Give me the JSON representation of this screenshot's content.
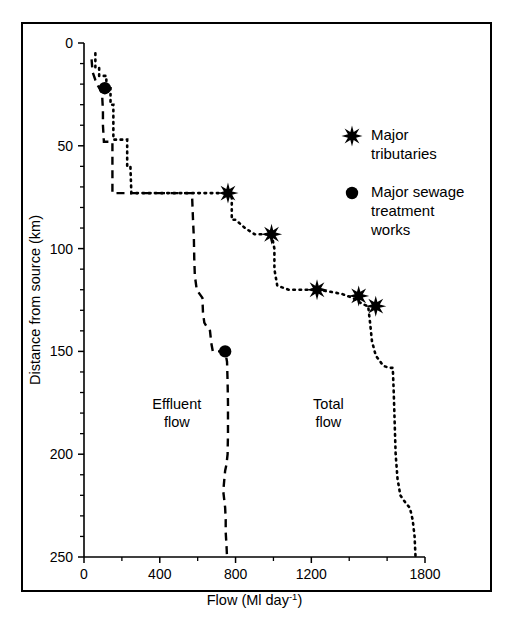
{
  "figure": {
    "frame_color": "#000000",
    "background": "#ffffff"
  },
  "chart_data": {
    "type": "line",
    "title": "",
    "xlabel_main": "Flow (Ml day",
    "xlabel_sup": "-1",
    "xlabel_tail": ")",
    "ylabel": "Distance from source (km)",
    "xlim": [
      0,
      1800
    ],
    "ylim": [
      0,
      250
    ],
    "y_inverted": true,
    "grid": false,
    "x_ticks": [
      0,
      400,
      800,
      1200,
      1800
    ],
    "x_tick_labels": [
      "0",
      "400",
      "800",
      "1200",
      "1800"
    ],
    "x_minor_ticks": [
      200,
      600,
      1000,
      1400,
      1600
    ],
    "y_ticks": [
      0,
      50,
      100,
      150,
      200,
      250
    ],
    "y_tick_labels": [
      "0",
      "50",
      "100",
      "150",
      "200",
      "250"
    ],
    "y_minor_ticks": [
      10,
      20,
      30,
      40,
      60,
      70,
      80,
      90,
      110,
      120,
      130,
      140,
      160,
      170,
      180,
      190,
      210,
      220,
      230,
      240
    ],
    "series": [
      {
        "name": "Total flow",
        "style": "dotted",
        "annotation": "Total flow",
        "annotation_x": 1290,
        "annotation_y": 178,
        "points": [
          [
            60,
            5
          ],
          [
            60,
            12
          ],
          [
            80,
            12
          ],
          [
            80,
            16
          ],
          [
            100,
            16
          ],
          [
            118,
            16
          ],
          [
            118,
            22
          ],
          [
            140,
            22
          ],
          [
            140,
            30
          ],
          [
            155,
            30
          ],
          [
            155,
            47
          ],
          [
            175,
            47
          ],
          [
            205,
            47
          ],
          [
            228,
            47
          ],
          [
            228,
            60
          ],
          [
            245,
            60
          ],
          [
            250,
            73
          ],
          [
            330,
            73
          ],
          [
            450,
            73
          ],
          [
            600,
            73
          ],
          [
            700,
            73
          ],
          [
            760,
            73
          ],
          [
            780,
            73
          ],
          [
            780,
            86
          ],
          [
            800,
            86
          ],
          [
            850,
            90
          ],
          [
            900,
            93
          ],
          [
            950,
            93
          ],
          [
            990,
            93
          ],
          [
            1005,
            100
          ],
          [
            1005,
            110
          ],
          [
            1020,
            118
          ],
          [
            1080,
            120
          ],
          [
            1160,
            120
          ],
          [
            1230,
            120
          ],
          [
            1300,
            121
          ],
          [
            1360,
            122
          ],
          [
            1420,
            124
          ],
          [
            1470,
            127
          ],
          [
            1500,
            128
          ],
          [
            1510,
            136
          ],
          [
            1520,
            145
          ],
          [
            1540,
            152
          ],
          [
            1580,
            157
          ],
          [
            1610,
            158
          ],
          [
            1630,
            158
          ],
          [
            1635,
            170
          ],
          [
            1640,
            185
          ],
          [
            1645,
            200
          ],
          [
            1655,
            212
          ],
          [
            1670,
            220
          ],
          [
            1700,
            224
          ],
          [
            1720,
            226
          ],
          [
            1735,
            232
          ],
          [
            1745,
            240
          ],
          [
            1750,
            250
          ]
        ]
      },
      {
        "name": "Effluent flow",
        "style": "dashed",
        "annotation": "Effluent flow",
        "annotation_x": 490,
        "annotation_y": 178,
        "points": [
          [
            40,
            8
          ],
          [
            45,
            14
          ],
          [
            60,
            18
          ],
          [
            75,
            21
          ],
          [
            95,
            24
          ],
          [
            100,
            33
          ],
          [
            100,
            40
          ],
          [
            105,
            48
          ],
          [
            120,
            48
          ],
          [
            150,
            48
          ],
          [
            150,
            56
          ],
          [
            150,
            63
          ],
          [
            150,
            73
          ],
          [
            220,
            73
          ],
          [
            350,
            73
          ],
          [
            450,
            73
          ],
          [
            530,
            73
          ],
          [
            560,
            73
          ],
          [
            570,
            73
          ],
          [
            575,
            85
          ],
          [
            580,
            95
          ],
          [
            582,
            105
          ],
          [
            585,
            113
          ],
          [
            595,
            120
          ],
          [
            610,
            122
          ],
          [
            625,
            124
          ],
          [
            628,
            131
          ],
          [
            635,
            136
          ],
          [
            648,
            138
          ],
          [
            665,
            140
          ],
          [
            672,
            146
          ],
          [
            680,
            150
          ],
          [
            700,
            150
          ],
          [
            730,
            150
          ],
          [
            745,
            150
          ],
          [
            755,
            155
          ],
          [
            758,
            165
          ],
          [
            760,
            175
          ],
          [
            760,
            190
          ],
          [
            758,
            200
          ],
          [
            752,
            205
          ],
          [
            745,
            208
          ],
          [
            740,
            213
          ],
          [
            735,
            218
          ],
          [
            740,
            222
          ],
          [
            745,
            226
          ],
          [
            748,
            232
          ],
          [
            748,
            238
          ],
          [
            752,
            244
          ],
          [
            755,
            250
          ]
        ]
      }
    ],
    "markers": [
      {
        "series": "Total flow",
        "type": "star",
        "label": "major-tributary",
        "points": [
          [
            760,
            73
          ],
          [
            990,
            93
          ],
          [
            1230,
            120
          ],
          [
            1450,
            123
          ],
          [
            1540,
            128
          ]
        ]
      },
      {
        "series": "Effluent flow",
        "type": "circle",
        "label": "major-sewage-treatment-works",
        "points": [
          [
            110,
            22
          ],
          [
            745,
            150
          ]
        ]
      }
    ]
  },
  "legend": {
    "position": "upper-right",
    "items": [
      {
        "marker": "star",
        "line1": "Major",
        "line2": "tributaries",
        "line3": ""
      },
      {
        "marker": "circle",
        "line1": "Major sewage",
        "line2": "treatment",
        "line3": "works"
      }
    ]
  }
}
